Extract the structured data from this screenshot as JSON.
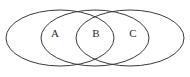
{
  "figure": {
    "name": "three-overlapping-ellipses-venn-diagram",
    "background_color": "#ffffff",
    "stroke_color": "#3a3a3a",
    "label_color": "#2b2b2b",
    "width": 190,
    "height": 77
  },
  "chart_data": {
    "type": "diagram",
    "title": "",
    "subtitle": "",
    "xlabel": "",
    "ylabel": "",
    "shapes": [
      {
        "id": "ellipse-left",
        "cx": 60,
        "cy": 38,
        "rx": 54,
        "ry": 28
      },
      {
        "id": "ellipse-middle",
        "cx": 95,
        "cy": 38,
        "rx": 54,
        "ry": 28
      },
      {
        "id": "ellipse-right",
        "cx": 130,
        "cy": 38,
        "rx": 54,
        "ry": 28
      }
    ],
    "annotations": [
      {
        "id": "label-a",
        "text": "A",
        "x": 55,
        "y": 34
      },
      {
        "id": "label-b",
        "text": "B",
        "x": 96,
        "y": 34
      },
      {
        "id": "label-c",
        "text": "C",
        "x": 133,
        "y": 34
      }
    ]
  },
  "labels": {
    "a": "A",
    "b": "B",
    "c": "C"
  }
}
